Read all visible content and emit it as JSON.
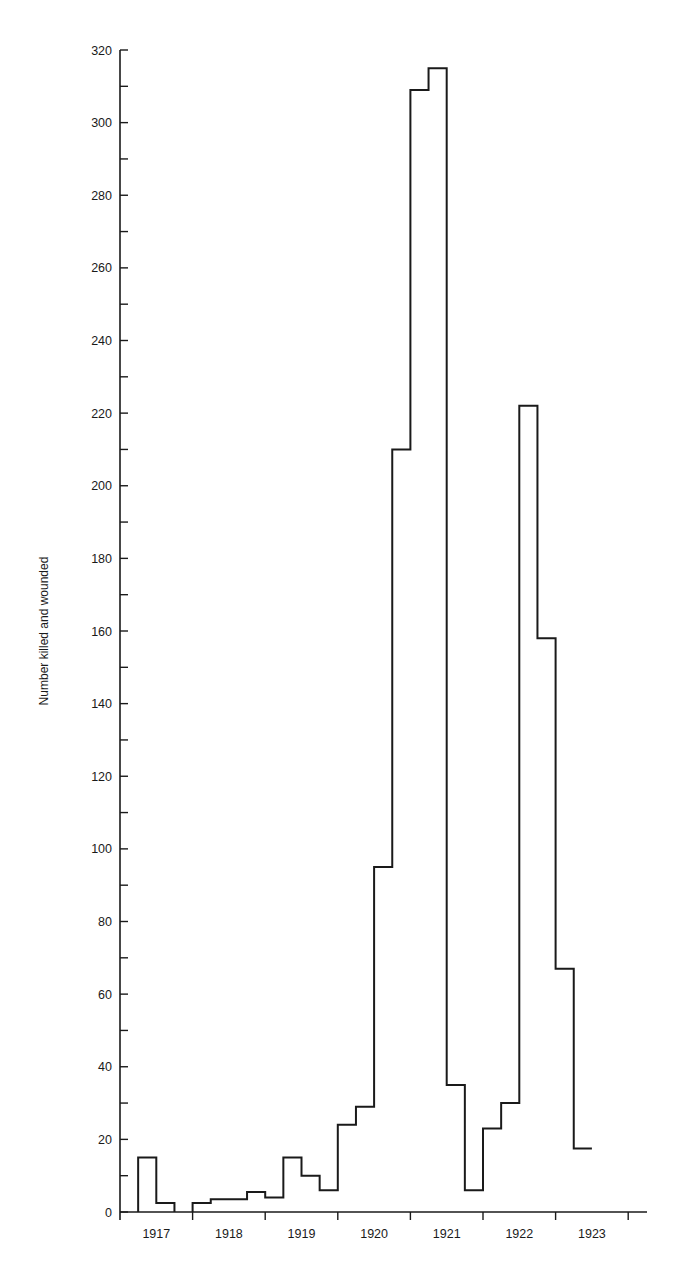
{
  "chart_data": {
    "type": "bar",
    "style": "step-histogram (quarterly)",
    "title": "",
    "xlabel": "",
    "ylabel": "Number killed and wounded",
    "ylim": [
      0,
      320
    ],
    "yticks_major": [
      0,
      20,
      40,
      60,
      80,
      100,
      120,
      140,
      160,
      180,
      200,
      220,
      240,
      260,
      280,
      300,
      320
    ],
    "yticks_minor_step": 10,
    "x_tick_labels": [
      "1917",
      "1918",
      "1919",
      "1920",
      "1921",
      "1922",
      "1923"
    ],
    "grid": false,
    "legend": null,
    "categories": [
      "1917 Q1",
      "1917 Q2",
      "1917 Q3",
      "1917 Q4",
      "1918 Q1",
      "1918 Q2",
      "1918 Q3",
      "1918 Q4",
      "1919 Q1",
      "1919 Q2",
      "1919 Q3",
      "1919 Q4",
      "1920 Q1",
      "1920 Q2",
      "1920 Q3",
      "1920 Q4",
      "1921 Q1",
      "1921 Q2",
      "1921 Q3",
      "1921 Q4",
      "1922 Q1",
      "1922 Q2",
      "1922 Q3",
      "1922 Q4",
      "1923 Q1",
      "1923 Q2"
    ],
    "values": [
      0,
      15,
      2.5,
      0,
      2.5,
      3.5,
      3.5,
      5.5,
      4,
      15,
      10,
      6,
      24,
      29,
      95,
      210,
      309,
      315,
      35,
      6,
      23,
      30,
      222,
      158,
      67,
      17.5
    ]
  },
  "layout": {
    "plot_left": 120,
    "plot_right": 647,
    "plot_top": 50,
    "plot_bottom": 1212,
    "year_width": 72.6,
    "line_color": "#1a1a1a"
  }
}
